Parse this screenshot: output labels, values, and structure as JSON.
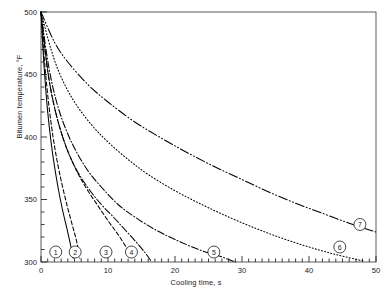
{
  "chart_data": {
    "type": "line",
    "title": "",
    "xlabel": "Cooling time, s",
    "ylabel": "Bitumen temperature, °F",
    "xlim": [
      0,
      50
    ],
    "ylim": [
      300,
      500
    ],
    "xticks": [
      0,
      10,
      20,
      30,
      40,
      50
    ],
    "xtick_labels": [
      "0",
      "10",
      "20",
      "30",
      "40",
      "50"
    ],
    "x_minor_step": 1,
    "yticks": [
      300,
      350,
      400,
      450,
      500
    ],
    "ytick_labels": [
      "300",
      "350",
      "400",
      "450",
      "500"
    ],
    "y_minor_step": 10,
    "grid": false,
    "legend": "inline-numbered-markers",
    "series": [
      {
        "name": "1",
        "label": "1",
        "style": "solid",
        "marker_label": "1",
        "marker_x": 2.2,
        "marker_y": 308,
        "points": [
          [
            0,
            500
          ],
          [
            0.3,
            470
          ],
          [
            0.6,
            446
          ],
          [
            1.0,
            420
          ],
          [
            1.5,
            396
          ],
          [
            2.0,
            377
          ],
          [
            2.6,
            358
          ],
          [
            3.2,
            342
          ],
          [
            3.9,
            326
          ],
          [
            4.4,
            314
          ],
          [
            4.8,
            303
          ]
        ]
      },
      {
        "name": "2",
        "label": "2",
        "style": "dashed",
        "marker_label": "2",
        "marker_x": 5.1,
        "marker_y": 308,
        "points": [
          [
            0,
            500
          ],
          [
            0.35,
            472
          ],
          [
            0.7,
            450
          ],
          [
            1.2,
            424
          ],
          [
            1.8,
            400
          ],
          [
            2.4,
            381
          ],
          [
            3.1,
            363
          ],
          [
            3.9,
            345
          ],
          [
            4.7,
            329
          ],
          [
            5.3,
            317
          ],
          [
            5.8,
            303
          ]
        ]
      },
      {
        "name": "3",
        "label": "3",
        "style": "dashed",
        "marker_label": "3",
        "marker_x": 9.7,
        "marker_y": 308,
        "points": [
          [
            0,
            500
          ],
          [
            0.6,
            470
          ],
          [
            1.2,
            446
          ],
          [
            2.0,
            424
          ],
          [
            3.0,
            404
          ],
          [
            4.2,
            386
          ],
          [
            5.6,
            370
          ],
          [
            7.0,
            357
          ],
          [
            8.5,
            345
          ],
          [
            10.0,
            333
          ],
          [
            11.5,
            322
          ],
          [
            12.8,
            311
          ],
          [
            13.6,
            303
          ]
        ]
      },
      {
        "name": "4",
        "label": "4",
        "style": "dash-dot",
        "marker_label": "4",
        "marker_x": 13.5,
        "marker_y": 308,
        "points": [
          [
            0,
            500
          ],
          [
            0.6,
            470
          ],
          [
            1.2,
            446
          ],
          [
            2.0,
            424
          ],
          [
            3.0,
            404
          ],
          [
            4.2,
            386
          ],
          [
            5.6,
            371
          ],
          [
            7.2,
            358
          ],
          [
            9.0,
            346
          ],
          [
            10.8,
            336
          ],
          [
            12.5,
            326
          ],
          [
            14.2,
            316
          ],
          [
            15.6,
            307
          ],
          [
            16.4,
            301
          ]
        ]
      },
      {
        "name": "5",
        "label": "5",
        "style": "dash-dot",
        "marker_label": "5",
        "marker_x": 25.8,
        "marker_y": 308,
        "points": [
          [
            0,
            500
          ],
          [
            0.8,
            468
          ],
          [
            1.6,
            444
          ],
          [
            2.6,
            423
          ],
          [
            3.8,
            405
          ],
          [
            5.2,
            389
          ],
          [
            7.0,
            373
          ],
          [
            9.0,
            360
          ],
          [
            11.5,
            346
          ],
          [
            14.0,
            336
          ],
          [
            17.0,
            326
          ],
          [
            20.0,
            318
          ],
          [
            23.5,
            310
          ],
          [
            26.5,
            305
          ],
          [
            29.0,
            300
          ]
        ]
      },
      {
        "name": "6",
        "label": "6",
        "style": "dotted",
        "marker_label": "6",
        "marker_x": 44.6,
        "marker_y": 312,
        "points": [
          [
            0,
            500
          ],
          [
            1.5,
            470
          ],
          [
            3.0,
            448
          ],
          [
            5.0,
            428
          ],
          [
            7.5,
            410
          ],
          [
            10.0,
            396
          ],
          [
            13.0,
            382
          ],
          [
            16.0,
            370
          ],
          [
            20.0,
            357
          ],
          [
            24.0,
            346
          ],
          [
            28.0,
            336
          ],
          [
            32.0,
            327
          ],
          [
            36.0,
            319
          ],
          [
            40.0,
            312
          ],
          [
            44.0,
            306
          ],
          [
            48.0,
            301
          ]
        ]
      },
      {
        "name": "7",
        "label": "7",
        "style": "dash-dot-dot",
        "marker_label": "7",
        "marker_x": 47.6,
        "marker_y": 330,
        "points": [
          [
            0,
            500
          ],
          [
            2.0,
            476
          ],
          [
            4.0,
            460
          ],
          [
            7.0,
            442
          ],
          [
            10.0,
            428
          ],
          [
            14.0,
            412
          ],
          [
            18.0,
            399
          ],
          [
            22.0,
            387
          ],
          [
            26.0,
            376
          ],
          [
            30.0,
            366
          ],
          [
            34.0,
            356
          ],
          [
            38.0,
            347
          ],
          [
            42.0,
            339
          ],
          [
            46.0,
            331
          ],
          [
            50.0,
            324
          ]
        ]
      }
    ]
  },
  "axes": {
    "frame_color": "#4a4a4a",
    "line_color": "#000000"
  }
}
